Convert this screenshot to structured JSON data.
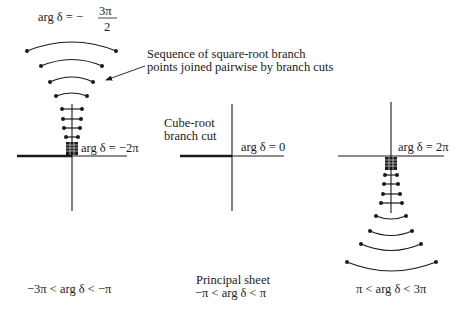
{
  "figure": {
    "panels": [
      {
        "id": "left",
        "axis_label": "arg δ = −2π",
        "top_label_prefix": "arg δ = −",
        "top_label_num": "3π",
        "top_label_den": "2",
        "range_label": "−3π < arg δ < −π"
      },
      {
        "id": "middle",
        "axis_label": "arg δ = 0",
        "cut_label_line1": "Cube-root",
        "cut_label_line2": "branch cut",
        "title": "Principal sheet",
        "range_label": "−π < arg δ < π"
      },
      {
        "id": "right",
        "axis_label": "arg δ = 2π",
        "range_label": "π < arg δ < 3π"
      }
    ],
    "annotation": {
      "line1": "Sequence of square-root branch",
      "line2": "points joined pairwise by branch cuts"
    },
    "colors": {
      "ink": "#1a1a1a",
      "background": "#ffffff"
    }
  }
}
